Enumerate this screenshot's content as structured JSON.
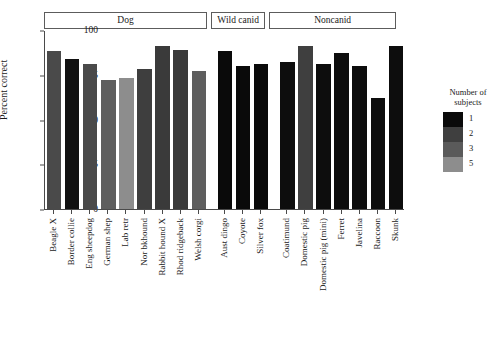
{
  "chart_data": {
    "type": "bar",
    "title": "",
    "xlabel": "",
    "ylabel": "Percent correct",
    "ylim": [
      0,
      100
    ],
    "yticks": [
      0,
      25,
      50,
      75,
      100
    ],
    "grid": false,
    "legend": {
      "title": "Number of\nsubjects",
      "position": "right",
      "entries": [
        {
          "label": "1",
          "color": "#0a0a0a"
        },
        {
          "label": "2",
          "color": "#3f3f3f"
        },
        {
          "label": "3",
          "color": "#5a5a5a"
        },
        {
          "label": "5",
          "color": "#8d8d8d"
        }
      ]
    },
    "panels": [
      {
        "name": "Dog",
        "categories": [
          "Beagle X",
          "Border collie",
          "Eng sheepdog",
          "German shep",
          "Lab retr",
          "Nor bkhound",
          "Rabbit hound X",
          "Rhod ridgeback",
          "Welsh corgi"
        ],
        "values": [
          88,
          84,
          81,
          72,
          73,
          78,
          91,
          89,
          77
        ],
        "subjects": [
          3,
          1,
          3,
          3,
          5,
          3,
          3,
          3,
          3
        ],
        "colors": [
          "#4a4a4a",
          "#111111",
          "#4a4a4a",
          "#5e5e5e",
          "#8d8d8d",
          "#3e3e3e",
          "#3a3a3a",
          "#3a3a3a",
          "#5e5e5e"
        ]
      },
      {
        "name": "Wild canid",
        "categories": [
          "Aust dingo",
          "Coyote",
          "Silver fox"
        ],
        "values": [
          88,
          80,
          81
        ],
        "subjects": [
          1,
          1,
          1
        ],
        "colors": [
          "#0a0a0a",
          "#0a0a0a",
          "#0a0a0a"
        ]
      },
      {
        "name": "Noncanid",
        "categories": [
          "Coatimund",
          "Domestic pig",
          "Domestic pig (mini)",
          "Ferret",
          "Javelina",
          "Raccoon",
          "Skunk"
        ],
        "values": [
          82,
          91,
          81,
          87,
          80,
          62,
          91
        ],
        "subjects": [
          1,
          2,
          1,
          1,
          1,
          1,
          1
        ],
        "colors": [
          "#0d0d0d",
          "#3f3f3f",
          "#0d0d0d",
          "#0d0d0d",
          "#0d0d0d",
          "#0d0d0d",
          "#0d0d0d"
        ]
      }
    ]
  }
}
